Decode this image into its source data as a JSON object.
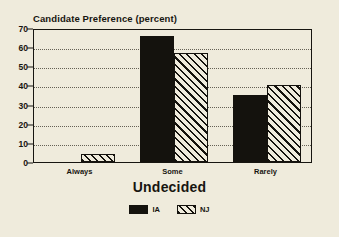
{
  "chart_data": {
    "type": "bar",
    "title": "Candidate Preference (percent)",
    "xlabel": "Undecided",
    "ylabel": "",
    "categories": [
      "Always",
      "Some",
      "Rarely"
    ],
    "series": [
      {
        "name": "IA",
        "color": "#14120d",
        "fill": "solid",
        "values": [
          0,
          66,
          35
        ]
      },
      {
        "name": "NJ",
        "color": "#14120d",
        "fill": "hatch-diagonal",
        "values": [
          4,
          57,
          40
        ]
      }
    ],
    "ylim": [
      0,
      70
    ],
    "yticks": [
      0,
      10,
      20,
      30,
      40,
      50,
      60,
      70
    ],
    "ytick_labels": [
      "0",
      "10",
      "20",
      "30",
      "40",
      "50",
      "60",
      "70"
    ],
    "grid": true,
    "grid_axis": "y",
    "legend_position": "bottom-center",
    "background_color": "#efebdc",
    "axis_color": "#171510"
  },
  "legend": {
    "entries": [
      {
        "label": "IA"
      },
      {
        "label": "NJ"
      }
    ]
  }
}
